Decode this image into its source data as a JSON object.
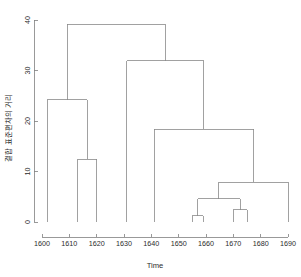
{
  "chart_data": {
    "type": "line",
    "chart_kind": "dendrogram",
    "title": "",
    "xlabel": "Time",
    "ylabel": "결합 표준편차의 거리",
    "xlim": [
      1596,
      1694
    ],
    "ylim": [
      0,
      41
    ],
    "xticks": [
      1600,
      1610,
      1620,
      1630,
      1640,
      1650,
      1660,
      1670,
      1680,
      1690
    ],
    "xtick_labels": [
      "1600",
      "1610",
      "1620",
      "1630",
      "1640",
      "1650",
      "1660",
      "1670",
      "1680",
      "1690"
    ],
    "yticks": [
      0,
      10,
      20,
      30,
      40
    ],
    "ytick_labels": [
      "0",
      "10",
      "20",
      "30",
      "40"
    ],
    "grid": false,
    "legend": null,
    "line_color": "#8a8a8a",
    "axis_color": "#808080",
    "leaves": [
      {
        "label": "1602",
        "x": 1602
      },
      {
        "label": "1613",
        "x": 1613
      },
      {
        "label": "1620",
        "x": 1620
      },
      {
        "label": "1631",
        "x": 1631
      },
      {
        "label": "1641",
        "x": 1641
      },
      {
        "label": "1655",
        "x": 1655
      },
      {
        "label": "1659",
        "x": 1659
      },
      {
        "label": "1670",
        "x": 1670
      },
      {
        "label": "1675",
        "x": 1675
      },
      {
        "label": "1690",
        "x": 1690
      }
    ],
    "merges": [
      {
        "id": "m1",
        "height": 1.2,
        "left_x": 1655,
        "left_h": 0,
        "right_x": 1659,
        "right_h": 0,
        "center_x": 1657.0
      },
      {
        "id": "m2",
        "height": 2.4,
        "left_x": 1670,
        "left_h": 0,
        "right_x": 1675,
        "right_h": 0,
        "center_x": 1672.5
      },
      {
        "id": "m3",
        "height": 4.6,
        "left_x": 1657.0,
        "left_h": 1.2,
        "right_x": 1672.5,
        "right_h": 2.4,
        "center_x": 1664.75
      },
      {
        "id": "m4",
        "height": 7.9,
        "left_x": 1664.75,
        "left_h": 4.6,
        "right_x": 1690,
        "right_h": 0,
        "center_x": 1677.4
      },
      {
        "id": "m5",
        "height": 12.4,
        "left_x": 1613,
        "left_h": 0,
        "right_x": 1620,
        "right_h": 0,
        "center_x": 1616.5
      },
      {
        "id": "m6",
        "height": 18.4,
        "left_x": 1641,
        "left_h": 0,
        "right_x": 1677.4,
        "right_h": 7.9,
        "center_x": 1659.2
      },
      {
        "id": "m7",
        "height": 24.2,
        "left_x": 1602,
        "left_h": 0,
        "right_x": 1616.5,
        "right_h": 12.4,
        "center_x": 1609.25
      },
      {
        "id": "m8",
        "height": 31.9,
        "left_x": 1631,
        "left_h": 0,
        "right_x": 1659.2,
        "right_h": 18.4,
        "center_x": 1645.1
      },
      {
        "id": "m9",
        "height": 39.2,
        "left_x": 1609.25,
        "left_h": 24.2,
        "right_x": 1645.1,
        "right_h": 31.9,
        "center_x": 1627.2
      }
    ]
  }
}
